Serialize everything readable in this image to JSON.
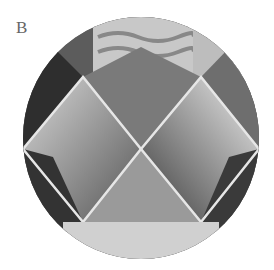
{
  "figure": {
    "panel_label": "B",
    "image_description": "Circular close-up photo of grey smocked fabric forming diamond pleats, patterned fabric at top",
    "colors": {
      "background": "#ffffff",
      "label": "#666666"
    }
  }
}
